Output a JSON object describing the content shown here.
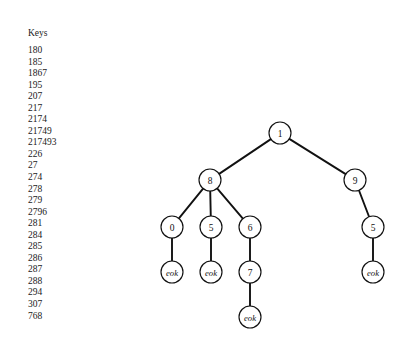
{
  "keys_panel": {
    "title": "Keys",
    "values": [
      "180",
      "185",
      "1867",
      "195",
      "207",
      "217",
      "2174",
      "21749",
      "217493",
      "226",
      "27",
      "274",
      "278",
      "279",
      "2796",
      "281",
      "284",
      "285",
      "286",
      "287",
      "288",
      "294",
      "307",
      "768"
    ]
  },
  "tree": {
    "colors": {
      "edge": "#111111",
      "node_stroke": "#111111",
      "node_fill": "#ffffff",
      "text": "#111111",
      "background": "#ffffff"
    },
    "node_radius": 11,
    "terminal_label": "eok",
    "nodes": [
      {
        "id": "n1",
        "label": "1",
        "x": 280,
        "y": 133,
        "terminal": false
      },
      {
        "id": "n8",
        "label": "8",
        "x": 210,
        "y": 180,
        "terminal": false
      },
      {
        "id": "n9",
        "label": "9",
        "x": 355,
        "y": 180,
        "terminal": false
      },
      {
        "id": "n0",
        "label": "0",
        "x": 172,
        "y": 227,
        "terminal": false
      },
      {
        "id": "n5a",
        "label": "5",
        "x": 211,
        "y": 227,
        "terminal": false
      },
      {
        "id": "n6",
        "label": "6",
        "x": 250,
        "y": 227,
        "terminal": false
      },
      {
        "id": "n5b",
        "label": "5",
        "x": 373,
        "y": 227,
        "terminal": false
      },
      {
        "id": "eok0",
        "label": "eok",
        "x": 172,
        "y": 272,
        "terminal": true
      },
      {
        "id": "eok5a",
        "label": "eok",
        "x": 211,
        "y": 272,
        "terminal": true
      },
      {
        "id": "n7",
        "label": "7",
        "x": 250,
        "y": 272,
        "terminal": false
      },
      {
        "id": "eok5b",
        "label": "eok",
        "x": 373,
        "y": 272,
        "terminal": true
      },
      {
        "id": "eok7",
        "label": "eok",
        "x": 250,
        "y": 317,
        "terminal": true
      }
    ],
    "edges": [
      {
        "from": "n1",
        "to": "n8"
      },
      {
        "from": "n1",
        "to": "n9"
      },
      {
        "from": "n8",
        "to": "n0"
      },
      {
        "from": "n8",
        "to": "n5a"
      },
      {
        "from": "n8",
        "to": "n6"
      },
      {
        "from": "n9",
        "to": "n5b"
      },
      {
        "from": "n0",
        "to": "eok0"
      },
      {
        "from": "n5a",
        "to": "eok5a"
      },
      {
        "from": "n6",
        "to": "n7"
      },
      {
        "from": "n5b",
        "to": "eok5b"
      },
      {
        "from": "n7",
        "to": "eok7"
      }
    ]
  }
}
